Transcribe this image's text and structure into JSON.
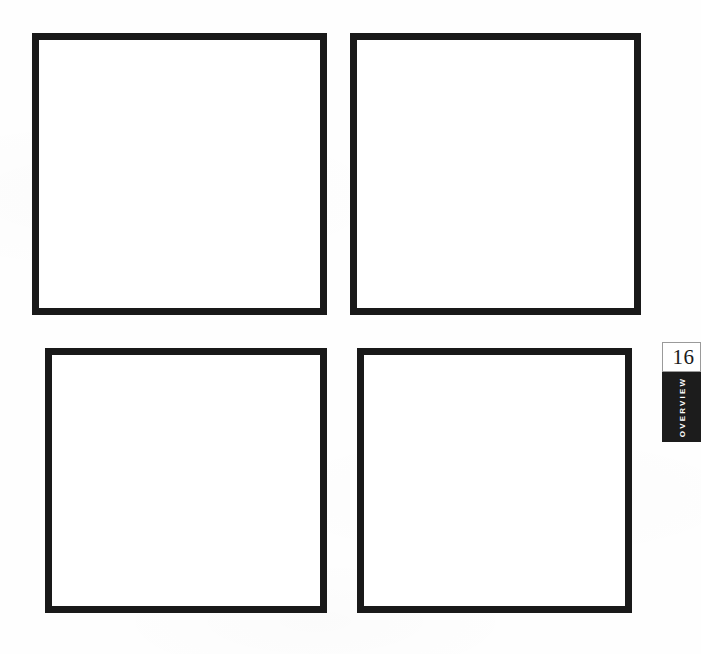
{
  "page": {
    "background_color": "#fefefe",
    "frame_border_color": "#191919",
    "frame_fill_color": "#ffffff"
  },
  "figure_grid": {
    "rows": 2,
    "columns": 2,
    "frames": [
      {
        "id": "frame-top-left",
        "caption": ""
      },
      {
        "id": "frame-top-right",
        "caption": ""
      },
      {
        "id": "frame-bottom-left",
        "caption": ""
      },
      {
        "id": "frame-bottom-right",
        "caption": ""
      }
    ]
  },
  "page_marker": {
    "number": "16",
    "section_label": "OVERVIEW",
    "number_box_color": "#ffffff",
    "label_box_color": "#1c1c1c",
    "label_text_color": "#ffffff"
  }
}
